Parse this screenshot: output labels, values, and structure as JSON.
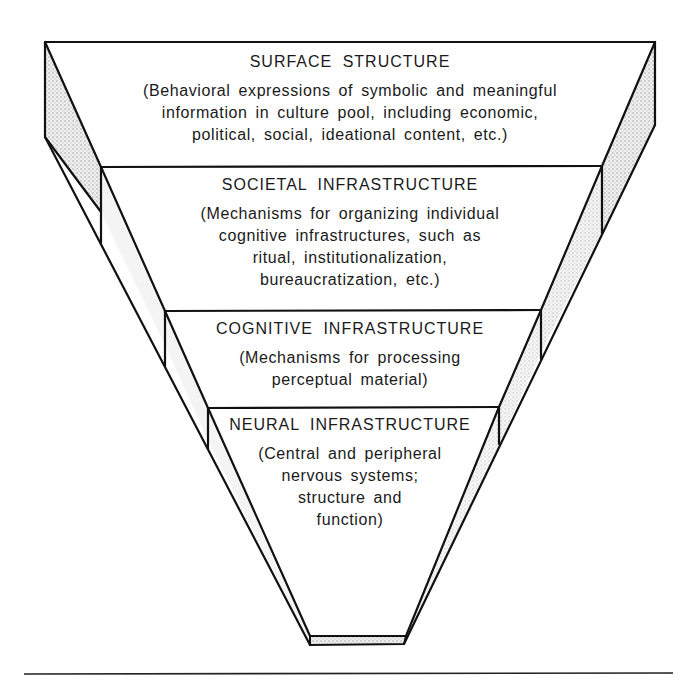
{
  "diagram": {
    "type": "inverted-pyramid",
    "tiers": [
      {
        "title": "SURFACE STRUCTURE",
        "description_lines": [
          "(Behavioral expressions of symbolic and meaningful",
          "information in culture pool, including economic,",
          "political, social, ideational content, etc.)"
        ]
      },
      {
        "title": "SOCIETAL INFRASTRUCTURE",
        "description_lines": [
          "(Mechanisms for organizing individual",
          "cognitive infrastructures, such as",
          "ritual, institutionalization,",
          "bureaucratization, etc.)"
        ]
      },
      {
        "title": "COGNITIVE INFRASTRUCTURE",
        "description_lines": [
          "(Mechanisms for processing",
          "perceptual material)"
        ]
      },
      {
        "title": "NEURAL INFRASTRUCTURE",
        "description_lines": [
          "(Central and peripheral",
          "nervous systems;",
          "structure and",
          "function)"
        ]
      }
    ],
    "colors": {
      "line": "#111111",
      "shade": "#d9d9d9",
      "background": "#ffffff"
    }
  }
}
